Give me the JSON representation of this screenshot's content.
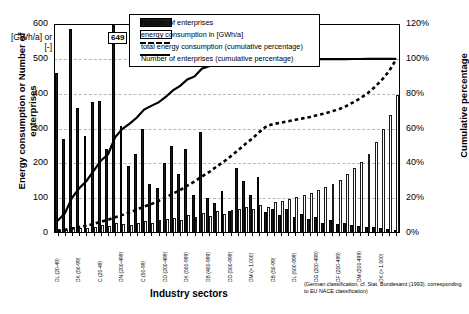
{
  "chart_data": {
    "type": "bar",
    "title": "",
    "xlabel": "Industry sectors",
    "ylabel": "Energy consumption or Number of enterprises",
    "ylabel_unit": "[GWh/a] or [-]",
    "y2label": "Cumulative percentage",
    "ylim": [
      0,
      600
    ],
    "yticks": [
      0,
      100,
      200,
      300,
      400,
      500,
      600
    ],
    "y2lim": [
      0,
      120
    ],
    "y2ticks": [
      "0%",
      "20%",
      "40%",
      "60%",
      "80%",
      "100%",
      "120%"
    ],
    "grid": true,
    "legend_position": "top-center",
    "annotation": "649",
    "footnote": "(German classification, cf. Stat. Bundesamt (1993), corresponding to EU NACE classification)",
    "categories": [
      "DL (20-49)",
      "DK (20-49)",
      "DN (50-99)",
      "DK (50-99)",
      "DH (20-49)",
      "DA (20-49)",
      "C (20-49)",
      "DN (100-199)",
      "DJ (50-99)",
      "DN (200-499)",
      "DK (200-499)",
      "DI (20-49)",
      "C (50-99)",
      "DC (200-499)",
      "DE (100-199)",
      "DD (200-499)",
      "DE (100-199)",
      "DD (200-499)",
      "DK (500-999)",
      "DM (500-999)",
      "DA (200-499)",
      "DB (400-999)",
      "DC (> 1.000)",
      "DA (500-999)",
      "DD (500-999)",
      "DJ (> 1.000)",
      "DI (200-499)",
      "DM (> 1.000)",
      "DI (500-999)",
      "DG (20-49)",
      "DB (50-99)",
      "DF (100-199)",
      "DH (200-499)",
      "DL (500-999)",
      "DE (> 1.000)",
      "DN (> 1.000)",
      "DG (200-499)",
      "DB (> 1.000)",
      "DH (500-999)",
      "DF (200-499)",
      "DA (> 1.000)",
      "DG (500-999)",
      "DM (200-499)",
      "DL (> 1.000)",
      "DF (500-999)",
      "DK (> 1.000)",
      "DG (> 1.000)",
      "DF (> 1.000)"
    ],
    "series": [
      {
        "name": "Number of enterprises",
        "kind": "bar",
        "color": "#1a1a1a",
        "values": [
          458,
          270,
          585,
          360,
          278,
          375,
          378,
          240,
          648,
          308,
          192,
          228,
          300,
          140,
          130,
          200,
          250,
          170,
          240,
          110,
          290,
          100,
          86,
          120,
          64,
          188,
          150,
          108,
          160,
          60,
          68,
          52,
          70,
          46,
          54,
          40,
          45,
          30,
          36,
          26,
          28,
          22,
          20,
          18,
          16,
          14,
          12,
          10
        ]
      },
      {
        "name": "energy consumption in [GWh/a]",
        "kind": "bar",
        "color": "#ffffff",
        "values": [
          12,
          8,
          16,
          13,
          14,
          18,
          22,
          20,
          30,
          26,
          24,
          30,
          34,
          28,
          36,
          40,
          44,
          38,
          52,
          46,
          58,
          50,
          62,
          56,
          66,
          70,
          74,
          68,
          80,
          76,
          88,
          92,
          98,
          104,
          110,
          116,
          124,
          132,
          142,
          152,
          168,
          186,
          204,
          228,
          262,
          300,
          338,
          396
        ]
      },
      {
        "name": "total energy consumption (cumulative percentage)",
        "kind": "line",
        "style": "dashed",
        "values": [
          1.0,
          1.8,
          2.6,
          3.4,
          4.2,
          5.2,
          6.4,
          7.6,
          9.0,
          10.4,
          11.8,
          13.4,
          15.2,
          16.6,
          18.4,
          20.4,
          22.6,
          24.6,
          27.2,
          29.6,
          32.4,
          34.9,
          38.0,
          40.8,
          44.0,
          47.4,
          51.0,
          54.2,
          58.0,
          61.4,
          62.6,
          63.4,
          64.2,
          65.0,
          65.8,
          66.6,
          67.6,
          68.6,
          69.8,
          71.0,
          72.8,
          75.0,
          77.4,
          80.2,
          83.8,
          88.0,
          93.0,
          100.0
        ]
      },
      {
        "name": "Number of enterprises (cumulative percentage)",
        "kind": "line",
        "style": "solid",
        "values": [
          7.0,
          11.2,
          20.2,
          25.7,
          29.9,
          35.7,
          41.5,
          45.2,
          55.1,
          59.8,
          62.8,
          66.3,
          70.9,
          73.0,
          75.0,
          78.1,
          81.9,
          84.5,
          88.2,
          89.9,
          94.3,
          95.8,
          97.2,
          98.1,
          98.6,
          99.0,
          99.2,
          99.3,
          99.4,
          99.5,
          99.55,
          99.6,
          99.65,
          99.7,
          99.72,
          99.75,
          99.78,
          99.8,
          99.83,
          99.85,
          99.87,
          99.89,
          99.91,
          99.93,
          99.95,
          99.97,
          99.99,
          100.0
        ]
      }
    ]
  },
  "legend": {
    "items": [
      {
        "label": "Number of enterprises",
        "marker": "filled-swatch"
      },
      {
        "label": "energy consumption in [GWh/a]",
        "marker": "open-swatch"
      },
      {
        "label": "total energy consumption (cumulative percentage)",
        "marker": "dashed-line"
      },
      {
        "label": "Number of enterprises (cumulative percentage)",
        "marker": "solid-line"
      }
    ]
  }
}
